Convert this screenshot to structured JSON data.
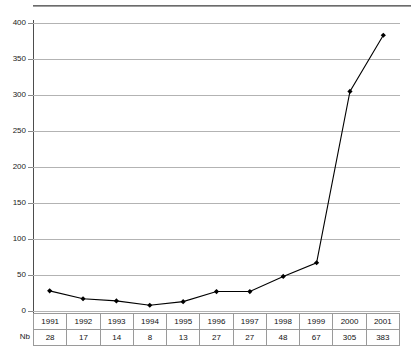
{
  "chart_data": {
    "type": "line",
    "title": "",
    "xlabel": "",
    "ylabel": "",
    "categories": [
      "1991",
      "1992",
      "1993",
      "1994",
      "1995",
      "1996",
      "1997",
      "1998",
      "1999",
      "2000",
      "2001"
    ],
    "values": [
      28,
      17,
      14,
      8,
      13,
      27,
      27,
      48,
      67,
      305,
      383
    ],
    "series": [
      {
        "name": "Nb",
        "values": [
          28,
          17,
          14,
          8,
          13,
          27,
          27,
          48,
          67,
          305,
          383
        ]
      }
    ],
    "ylim": [
      0,
      400
    ],
    "ytick_labels": [
      "0",
      "50",
      "100",
      "150",
      "200",
      "250",
      "300",
      "350",
      "400"
    ],
    "ytick_values": [
      0,
      50,
      100,
      150,
      200,
      250,
      300,
      350,
      400
    ],
    "grid": true,
    "legend": false,
    "marker": "filled-diamond",
    "line_color": "#000000",
    "marker_color": "#000000",
    "grid_color": "#b3b3b3",
    "axis_color": "#4d4d4d",
    "background_color": "#ffffff"
  },
  "table": {
    "row_label": "Nb",
    "header_row": [
      "1991",
      "1992",
      "1993",
      "1994",
      "1995",
      "1996",
      "1997",
      "1998",
      "1999",
      "2000",
      "2001"
    ],
    "value_row": [
      "28",
      "17",
      "14",
      "8",
      "13",
      "27",
      "27",
      "48",
      "67",
      "305",
      "383"
    ]
  }
}
